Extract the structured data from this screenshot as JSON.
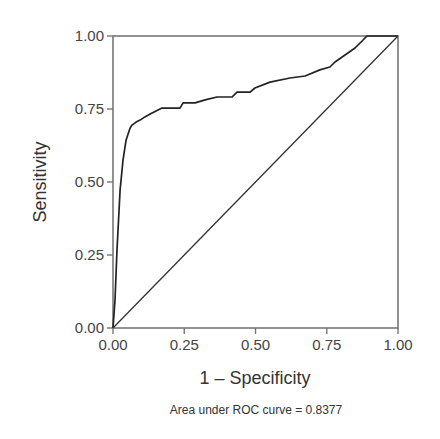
{
  "chart_data": {
    "type": "line",
    "title": "",
    "xlabel": "1 – Specificity",
    "ylabel": "Sensitivity",
    "caption": "Area under ROC curve = 0.8377",
    "xlim": [
      0,
      1
    ],
    "ylim": [
      0,
      1
    ],
    "grid": false,
    "legend": null,
    "x_ticks": [
      "0.00",
      "0.25",
      "0.50",
      "0.75",
      "1.00"
    ],
    "y_ticks": [
      "0.00",
      "0.25",
      "0.50",
      "0.75",
      "1.00"
    ],
    "auc": 0.8377,
    "series": [
      {
        "name": "ROC curve",
        "color": "#222222",
        "x": [
          0.0,
          0.007,
          0.014,
          0.025,
          0.035,
          0.046,
          0.06,
          0.067,
          0.081,
          0.095,
          0.112,
          0.13,
          0.172,
          0.235,
          0.246,
          0.288,
          0.323,
          0.365,
          0.418,
          0.435,
          0.481,
          0.498,
          0.551,
          0.621,
          0.674,
          0.726,
          0.761,
          0.779,
          0.814,
          0.849,
          0.874,
          0.891,
          1.0
        ],
        "y": [
          0.0,
          0.096,
          0.267,
          0.473,
          0.575,
          0.644,
          0.685,
          0.695,
          0.705,
          0.712,
          0.723,
          0.733,
          0.753,
          0.753,
          0.771,
          0.771,
          0.781,
          0.791,
          0.791,
          0.808,
          0.808,
          0.822,
          0.842,
          0.856,
          0.863,
          0.884,
          0.894,
          0.911,
          0.935,
          0.959,
          0.983,
          1.0,
          1.0
        ]
      },
      {
        "name": "Reference line",
        "color": "#333333",
        "x": [
          0,
          1
        ],
        "y": [
          0,
          1
        ]
      }
    ]
  }
}
